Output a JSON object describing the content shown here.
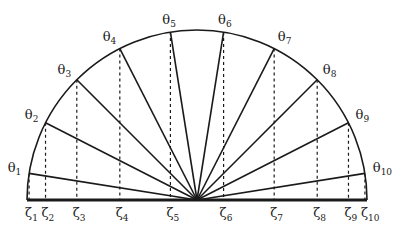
{
  "diagram": {
    "type": "semicircle-chebyshev-nodes",
    "center": {
      "x": 197,
      "y": 200
    },
    "radius": 170,
    "n": 10,
    "colors": {
      "stroke": "#1a1a1a",
      "background": "#ffffff"
    },
    "theta_symbol": "θ",
    "zeta_symbol": "ζ",
    "theta_labels": [
      {
        "sym": "θ",
        "sub": "1"
      },
      {
        "sym": "θ",
        "sub": "2"
      },
      {
        "sym": "θ",
        "sub": "3"
      },
      {
        "sym": "θ",
        "sub": "4"
      },
      {
        "sym": "θ",
        "sub": "5"
      },
      {
        "sym": "θ",
        "sub": "6"
      },
      {
        "sym": "θ",
        "sub": "7"
      },
      {
        "sym": "θ",
        "sub": "8"
      },
      {
        "sym": "θ",
        "sub": "9"
      },
      {
        "sym": "θ",
        "sub": "10"
      }
    ],
    "zeta_labels": [
      {
        "sym": "ζ",
        "sub": "1"
      },
      {
        "sym": "ζ",
        "sub": "2"
      },
      {
        "sym": "ζ",
        "sub": "3"
      },
      {
        "sym": "ζ",
        "sub": "4"
      },
      {
        "sym": "ζ",
        "sub": "5"
      },
      {
        "sym": "ζ",
        "sub": "6"
      },
      {
        "sym": "ζ",
        "sub": "7"
      },
      {
        "sym": "ζ",
        "sub": "8"
      },
      {
        "sym": "ζ",
        "sub": "9"
      },
      {
        "sym": "ζ",
        "sub": "10"
      }
    ]
  }
}
